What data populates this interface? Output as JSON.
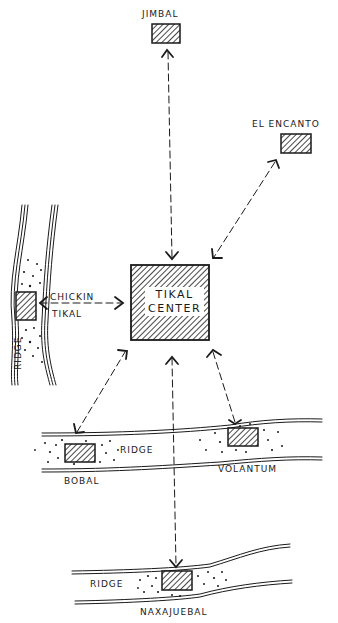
{
  "diagram": {
    "type": "hand-drawn site map",
    "center": {
      "line1": "TIKAL",
      "line2": "CENTER"
    },
    "sites": {
      "jimbal": "JIMBAL",
      "el_encanto": "EL ENCANTO",
      "chickin_tikal_line1": "CHICKIN",
      "chickin_tikal_line2": "TIKAL",
      "bobal": "BOBAL",
      "volantum": "VOLANTUM",
      "naxajuebal": "NAXAJUEBAL"
    },
    "ridge_labels": {
      "left": "RIDGE",
      "middle": "RIDGE",
      "bottom": "RIDGE"
    },
    "colors": {
      "ink": "#1a1a1a",
      "background": "#ffffff"
    }
  }
}
